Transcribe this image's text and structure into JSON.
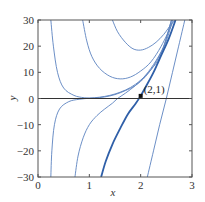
{
  "chart_data": {
    "type": "line",
    "title": "",
    "xlabel": "x",
    "ylabel": "y",
    "xlim": [
      0,
      3
    ],
    "ylim": [
      -30,
      30
    ],
    "x_ticks": [
      0,
      1,
      2,
      3
    ],
    "x_tick_labels": [
      "0",
      "1",
      "2",
      "3"
    ],
    "y_ticks": [
      30,
      20,
      10,
      0,
      -10,
      -20,
      -30
    ],
    "y_tick_labels": [
      "30",
      "20",
      "10",
      "0",
      "−10",
      "−20",
      "−30"
    ],
    "grid": false,
    "legend": null,
    "annotations": [
      {
        "text": "(2,1)",
        "x": 2,
        "y": 1,
        "marker": "filled-square"
      }
    ],
    "series": [
      {
        "name": "solution-curve-1",
        "highlight": false,
        "points": [
          [
            0.25,
            30
          ],
          [
            0.3,
            20
          ],
          [
            0.38,
            10
          ],
          [
            0.5,
            4
          ],
          [
            0.7,
            1.2
          ],
          [
            0.9,
            0.3
          ],
          [
            1.1,
            0.2
          ],
          [
            1.3,
            0.6
          ],
          [
            1.5,
            1.5
          ],
          [
            1.7,
            3
          ],
          [
            1.9,
            5
          ],
          [
            2.1,
            8.5
          ],
          [
            2.3,
            14
          ],
          [
            2.45,
            20
          ],
          [
            2.6,
            30
          ]
        ]
      },
      {
        "name": "solution-curve-2",
        "highlight": false,
        "points": [
          [
            0.87,
            30
          ],
          [
            0.95,
            22
          ],
          [
            1.05,
            16
          ],
          [
            1.2,
            11.5
          ],
          [
            1.4,
            8.5
          ],
          [
            1.6,
            7.5
          ],
          [
            1.8,
            8.2
          ],
          [
            2.0,
            10.5
          ],
          [
            2.2,
            14
          ],
          [
            2.4,
            20
          ],
          [
            2.6,
            28
          ],
          [
            2.63,
            30
          ]
        ]
      },
      {
        "name": "solution-curve-3",
        "highlight": false,
        "points": [
          [
            1.45,
            30
          ],
          [
            1.55,
            25.5
          ],
          [
            1.7,
            21.5
          ],
          [
            1.85,
            19
          ],
          [
            2.0,
            18.5
          ],
          [
            2.15,
            19.5
          ],
          [
            2.3,
            21.5
          ],
          [
            2.45,
            24.5
          ],
          [
            2.6,
            28.5
          ],
          [
            2.68,
            30
          ]
        ]
      },
      {
        "name": "solution-curve-4",
        "highlight": false,
        "points": [
          [
            0.25,
            -30
          ],
          [
            0.27,
            -20
          ],
          [
            0.32,
            -10
          ],
          [
            0.42,
            -4
          ],
          [
            0.6,
            -1.2
          ],
          [
            0.8,
            -0.3
          ],
          [
            1.0,
            0.1
          ],
          [
            1.2,
            0.5
          ],
          [
            1.4,
            1.2
          ],
          [
            1.6,
            2.4
          ],
          [
            1.8,
            4.2
          ],
          [
            2.0,
            7
          ],
          [
            2.2,
            11
          ],
          [
            2.4,
            17
          ],
          [
            2.6,
            30
          ]
        ]
      },
      {
        "name": "solution-curve-5",
        "highlight": false,
        "points": [
          [
            0.72,
            -30
          ],
          [
            0.78,
            -22
          ],
          [
            0.88,
            -15
          ],
          [
            1.0,
            -10
          ],
          [
            1.15,
            -6.5
          ],
          [
            1.3,
            -4
          ],
          [
            1.45,
            -1.8
          ],
          [
            1.55,
            0
          ],
          [
            1.7,
            2
          ],
          [
            1.9,
            5
          ],
          [
            2.1,
            9
          ],
          [
            2.3,
            14.5
          ],
          [
            2.5,
            22
          ],
          [
            2.62,
            30
          ]
        ]
      },
      {
        "name": "solution-curve-6",
        "highlight": true,
        "points": [
          [
            1.23,
            -30
          ],
          [
            1.32,
            -24
          ],
          [
            1.45,
            -17.5
          ],
          [
            1.6,
            -11.5
          ],
          [
            1.75,
            -6
          ],
          [
            1.9,
            -2
          ],
          [
            2.0,
            1
          ],
          [
            2.1,
            4.5
          ],
          [
            2.25,
            10
          ],
          [
            2.4,
            16.5
          ],
          [
            2.55,
            23
          ],
          [
            2.68,
            30
          ]
        ]
      },
      {
        "name": "solution-curve-7",
        "highlight": false,
        "points": [
          [
            2.13,
            -30
          ],
          [
            2.25,
            -20
          ],
          [
            2.37,
            -10
          ],
          [
            2.5,
            0
          ],
          [
            2.62,
            10
          ],
          [
            2.74,
            20
          ],
          [
            2.86,
            30
          ]
        ]
      }
    ]
  }
}
